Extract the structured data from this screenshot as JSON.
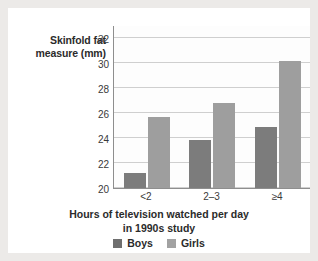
{
  "chart_data": {
    "type": "bar",
    "title": "",
    "categories": [
      "<2",
      "2–3",
      "≥4"
    ],
    "series": [
      {
        "name": "Boys",
        "values": [
          21.2,
          23.8,
          24.9
        ],
        "color": "#7c7c7c"
      },
      {
        "name": "Girls",
        "values": [
          25.7,
          26.8,
          30.1
        ],
        "color": "#9e9e9e"
      }
    ],
    "xlabel_line1": "Hours of television watched per day",
    "xlabel_line2": "in 1990s study",
    "ylabel_line1": "Skinfold fat",
    "ylabel_line2": "measure (mm)",
    "ylim": [
      20,
      33
    ],
    "yticks": [
      20,
      22,
      24,
      26,
      28,
      30,
      32
    ],
    "ytick_labels": [
      "20",
      "22",
      "24",
      "26",
      "28",
      "30",
      "32"
    ],
    "grid": true,
    "legend_position": "bottom",
    "legend": [
      "Boys",
      "Girls"
    ]
  },
  "colors": {
    "page_background": "#eceae8",
    "card_background": "#ffffff",
    "boys": "#7c7c7c",
    "girls": "#9e9e9e",
    "gridline": "#cfcfcf",
    "axis": "#8e8e8e",
    "text": "#2b2b2b"
  }
}
